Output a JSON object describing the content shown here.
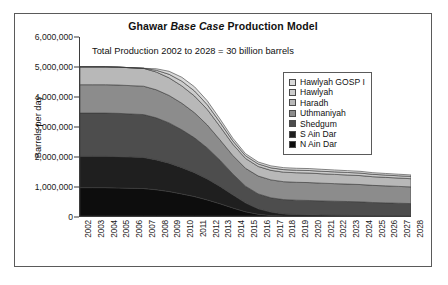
{
  "figure": {
    "title_prefix": "Ghawar ",
    "title_italic": "Base Case",
    "title_suffix": " Production Model",
    "title_full": "Ghawar Base Case Production Model",
    "annotation": "Total Production 2002 to 2028 = 30 billion barrels"
  },
  "chart_data": {
    "type": "area",
    "stacked": true,
    "title": "Ghawar Base Case Production Model",
    "annotation": "Total Production 2002 to 2028 = 30 billion barrels",
    "xlabel": "",
    "ylabel": "Barrels per day",
    "ylim": [
      0,
      6000000
    ],
    "ytick_values": [
      0,
      1000000,
      2000000,
      3000000,
      4000000,
      5000000,
      6000000
    ],
    "ytick_labels": [
      "0",
      "1,000,000",
      "2,000,000",
      "3,000,000",
      "4,000,000",
      "5,000,000",
      "6,000,000"
    ],
    "grid": false,
    "legend_position": "upper right",
    "categories": [
      "2002",
      "2003",
      "2004",
      "2005",
      "2006",
      "2007",
      "2008",
      "2009",
      "2010",
      "2011",
      "2012",
      "2013",
      "2014",
      "2015",
      "2016",
      "2017",
      "2018",
      "2019",
      "2020",
      "2021",
      "2022",
      "2023",
      "2024",
      "2025",
      "2026",
      "2027",
      "2028"
    ],
    "stack_order_bottom_to_top": [
      "N Ain Dar",
      "S Ain Dar",
      "Shedgum",
      "Uthmaniyah",
      "Haradh",
      "Hawlyah",
      "Hawlyah GOSP I"
    ],
    "series": [
      {
        "name": "N Ain Dar",
        "color": "#0d0d0d",
        "values": [
          950000,
          950000,
          950000,
          940000,
          930000,
          920000,
          880000,
          820000,
          740000,
          650000,
          540000,
          410000,
          270000,
          140000,
          60000,
          20000,
          0,
          0,
          0,
          0,
          0,
          0,
          0,
          0,
          0,
          0,
          0
        ]
      },
      {
        "name": "S Ain Dar",
        "color": "#1f1f1f",
        "values": [
          1050000,
          1050000,
          1050000,
          1050000,
          1045000,
          1040000,
          1000000,
          950000,
          880000,
          800000,
          700000,
          580000,
          440000,
          300000,
          180000,
          110000,
          70000,
          50000,
          40000,
          30000,
          25000,
          20000,
          15000,
          12000,
          10000,
          8000,
          6000
        ]
      },
      {
        "name": "Shedgum",
        "color": "#4d4d4d",
        "values": [
          1450000,
          1450000,
          1450000,
          1450000,
          1445000,
          1440000,
          1410000,
          1350000,
          1270000,
          1170000,
          1040000,
          880000,
          700000,
          560000,
          500000,
          480000,
          480000,
          480000,
          480000,
          475000,
          470000,
          465000,
          460000,
          440000,
          430000,
          420000,
          410000
        ]
      },
      {
        "name": "Uthmaniyah",
        "color": "#8c8c8c",
        "values": [
          950000,
          950000,
          950000,
          950000,
          950000,
          950000,
          940000,
          920000,
          890000,
          840000,
          770000,
          680000,
          620000,
          600000,
          600000,
          600000,
          600000,
          600000,
          600000,
          595000,
          590000,
          585000,
          580000,
          575000,
          570000,
          565000,
          560000
        ]
      },
      {
        "name": "Haradh",
        "color": "#b8b8b8",
        "values": [
          600000,
          600000,
          600000,
          600000,
          600000,
          600000,
          595000,
          590000,
          580000,
          560000,
          520000,
          450000,
          380000,
          330000,
          320000,
          320000,
          320000,
          320000,
          320000,
          315000,
          310000,
          305000,
          300000,
          290000,
          285000,
          280000,
          275000
        ]
      },
      {
        "name": "Hawlyah",
        "color": "#cccccc",
        "values": [
          0,
          0,
          0,
          0,
          0,
          0,
          60000,
          120000,
          160000,
          170000,
          160000,
          140000,
          110000,
          90000,
          85000,
          85000,
          85000,
          85000,
          85000,
          85000,
          85000,
          85000,
          85000,
          80000,
          78000,
          76000,
          75000
        ]
      },
      {
        "name": "Hawlyah GOSP I",
        "color": "#d9d9d9",
        "values": [
          0,
          0,
          0,
          0,
          0,
          0,
          50000,
          100000,
          130000,
          140000,
          130000,
          110000,
          90000,
          70000,
          65000,
          65000,
          65000,
          65000,
          65000,
          65000,
          62000,
          60000,
          58000,
          55000,
          53000,
          52000,
          50000
        ]
      }
    ],
    "total_top_line": [
      5000000,
      5000000,
      5000000,
      4990000,
      4970000,
      4950000,
      4935000,
      4850000,
      4650000,
      4330000,
      3860000,
      3250000,
      2610000,
      2090000,
      1810000,
      1680000,
      1620000,
      1600000,
      1590000,
      1565000,
      1542000,
      1520000,
      1498000,
      1452000,
      1426000,
      1401000,
      1376000
    ]
  },
  "legend": {
    "items": [
      {
        "label": "Hawlyah GOSP I",
        "color": "#d9d9d9"
      },
      {
        "label": "Hawlyah",
        "color": "#cccccc"
      },
      {
        "label": "Haradh",
        "color": "#b8b8b8"
      },
      {
        "label": "Uthmaniyah",
        "color": "#8c8c8c"
      },
      {
        "label": "Shedgum",
        "color": "#4d4d4d"
      },
      {
        "label": "S Ain Dar",
        "color": "#1f1f1f"
      },
      {
        "label": "N Ain Dar",
        "color": "#0d0d0d"
      }
    ]
  }
}
